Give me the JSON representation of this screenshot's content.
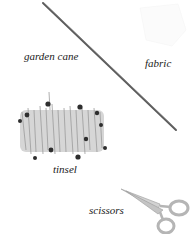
{
  "labels": {
    "garden_cane": "garden cane",
    "fabric": "fabric",
    "tinsel": "tinsel",
    "scissors": "scissors"
  },
  "items": [
    {
      "name": "garden cane",
      "icon": "garden-cane-icon"
    },
    {
      "name": "fabric",
      "icon": "fabric-icon"
    },
    {
      "name": "tinsel",
      "icon": "tinsel-icon"
    },
    {
      "name": "scissors",
      "icon": "scissors-icon"
    }
  ],
  "colors": {
    "background": "#ffffff",
    "cane": "#5a5a5a",
    "tinsel": "#a8a8a8",
    "tinsel_stars": "#2e2e2e",
    "scissors": "#c8c8c8",
    "text": "#1a1a1a"
  }
}
